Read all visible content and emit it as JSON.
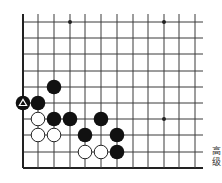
{
  "diagram": {
    "type": "go-board-fragment",
    "grid": {
      "columns_x": [
        23,
        38,
        54,
        70,
        85,
        101,
        117,
        133,
        148,
        164,
        179,
        195
      ],
      "rows_y": [
        22,
        38,
        54,
        71,
        87,
        103,
        119,
        135,
        152,
        168
      ],
      "line_color": "#3a3a3a",
      "edge_color": "#222222",
      "left_edge": true,
      "bottom_edge": true,
      "top_extends": true,
      "right_extends": true
    },
    "star_points": [
      {
        "col": 3,
        "row": 0
      },
      {
        "col": 9,
        "row": 0
      },
      {
        "col": 9,
        "row": 6
      }
    ],
    "stones": [
      {
        "color": "black",
        "col": 2,
        "row": 4
      },
      {
        "color": "black",
        "col": 0,
        "row": 5,
        "marker": "triangle"
      },
      {
        "color": "black",
        "col": 1,
        "row": 5
      },
      {
        "color": "white",
        "col": 1,
        "row": 6
      },
      {
        "color": "black",
        "col": 2,
        "row": 6
      },
      {
        "color": "black",
        "col": 3,
        "row": 6
      },
      {
        "color": "black",
        "col": 5,
        "row": 6
      },
      {
        "color": "white",
        "col": 1,
        "row": 7
      },
      {
        "color": "white",
        "col": 2,
        "row": 7
      },
      {
        "color": "black",
        "col": 4,
        "row": 7
      },
      {
        "color": "black",
        "col": 6,
        "row": 7
      },
      {
        "color": "white",
        "col": 4,
        "row": 8
      },
      {
        "color": "white",
        "col": 5,
        "row": 8
      },
      {
        "color": "black",
        "col": 6,
        "row": 8
      }
    ],
    "colors": {
      "black_stone": "#111111",
      "white_stone": "#ffffff",
      "white_stone_border": "#222222",
      "marker": "#ffffff"
    }
  },
  "side_text": {
    "line1": "高",
    "line2": "级"
  }
}
